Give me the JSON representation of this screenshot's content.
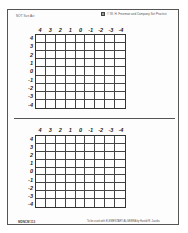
{
  "header": {
    "left_text": "NOT Sun Act",
    "right_text": "© W. H. Freeman and Company   Set Practice",
    "logo_icon": "publisher-logo-icon"
  },
  "grids": [
    {
      "id": "top",
      "col_labels": [
        "4",
        "3",
        "2",
        "1",
        "0",
        "-1",
        "-2",
        "-3",
        "-4"
      ],
      "row_labels": [
        "4",
        "3",
        "2",
        "1",
        "0",
        "-1",
        "-2",
        "-3",
        "-4"
      ],
      "rows": 9,
      "cols": 9
    },
    {
      "id": "bottom",
      "col_labels": [
        "4",
        "3",
        "2",
        "1",
        "0",
        "-1",
        "-2",
        "-3",
        "-4"
      ],
      "row_labels": [
        "4",
        "3",
        "2",
        "1",
        "0",
        "-1",
        "-2",
        "-3",
        "-4"
      ],
      "rows": 9,
      "cols": 9
    }
  ],
  "footer": {
    "left_text": "MDNCM 113",
    "right_text": "To be used with ELEMENTARY ALGEBRA by Harold R. Jacobs"
  },
  "colors": {
    "frame": "#555555",
    "grid_line": "#444444",
    "text": "#222222"
  }
}
